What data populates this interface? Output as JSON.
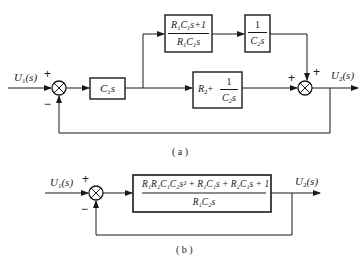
{
  "diagram_a": {
    "caption": "( a )",
    "input_label": "U",
    "input_sub": "1",
    "input_arg": "(s)",
    "output_label": "U",
    "output_sub": "2",
    "output_arg": "(s)",
    "sum1": {
      "plus": "+",
      "minus": "−"
    },
    "sum2": {
      "plus_left": "+",
      "plus_top": "+"
    },
    "block_c1s": {
      "main": "C",
      "sub": "1",
      "tail": "s"
    },
    "block_top1": {
      "num": {
        "a": "R",
        "a_sub": "1",
        "b": "C",
        "b_sub": "1",
        "tail": "s+1"
      },
      "den": {
        "a": "R",
        "a_sub": "1",
        "b": "C",
        "b_sub": "1",
        "tail": "s"
      }
    },
    "block_top2": {
      "num": "1",
      "den": {
        "a": "C",
        "a_sub": "2",
        "tail": "s"
      }
    },
    "block_mid": {
      "left": "R",
      "left_sub": "2",
      "plus": "+",
      "num": "1",
      "den": {
        "a": "C",
        "a_sub": "2",
        "tail": "s"
      }
    }
  },
  "diagram_b": {
    "caption": "( b )",
    "input_label": "U",
    "input_sub": "1",
    "input_arg": "(s)",
    "output_label": "U",
    "output_sub": "2",
    "output_arg": "(s)",
    "sum": {
      "plus": "+",
      "minus": "−"
    },
    "block": {
      "num": "R₁R₂C₁C₂s² + R₁C₁s + R₂C₁s + 1",
      "den": "R₁C₂s"
    }
  }
}
